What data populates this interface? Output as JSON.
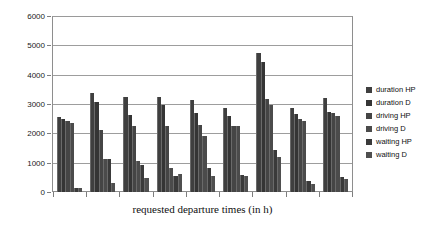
{
  "chart_data": {
    "type": "bar",
    "title": "",
    "xlabel": "requested departure times (in h)",
    "ylabel": "",
    "ylim": [
      0,
      6000
    ],
    "ytick_values": [
      0,
      1000,
      2000,
      3000,
      4000,
      5000,
      6000
    ],
    "ytick_labels": [
      "0",
      "1000",
      "2000",
      "3000",
      "4000",
      "5000",
      "6000"
    ],
    "grid": true,
    "legend_position": "right",
    "categories": [
      "1",
      "2",
      "3",
      "4",
      "5",
      "6",
      "7",
      "8",
      "9"
    ],
    "series": [
      {
        "name": "duration HP",
        "color": "#3f3f3f",
        "values": [
          2570,
          3400,
          3250,
          3260,
          3150,
          2880,
          4780,
          2870,
          3230
        ]
      },
      {
        "name": "duration D",
        "color": "#353535",
        "values": [
          2500,
          3080,
          2640,
          2980,
          2700,
          2620,
          4450,
          2690,
          2760
        ]
      },
      {
        "name": "driving HP",
        "color": "#454545",
        "values": [
          2430,
          2130,
          2250,
          2270,
          2310,
          2280,
          3180,
          2490,
          2700
        ]
      },
      {
        "name": "driving D",
        "color": "#4b4b4b",
        "values": [
          2370,
          1120,
          1070,
          840,
          1920,
          2250,
          2970,
          2430,
          2620
        ]
      },
      {
        "name": "waiting HP",
        "color": "#3a3a3a",
        "values": [
          140,
          1120,
          920,
          560,
          820,
          600,
          1430,
          370,
          520
        ]
      },
      {
        "name": "waiting D",
        "color": "#4f4f4f",
        "values": [
          130,
          310,
          480,
          630,
          550,
          540,
          1200,
          290,
          440
        ]
      }
    ]
  }
}
